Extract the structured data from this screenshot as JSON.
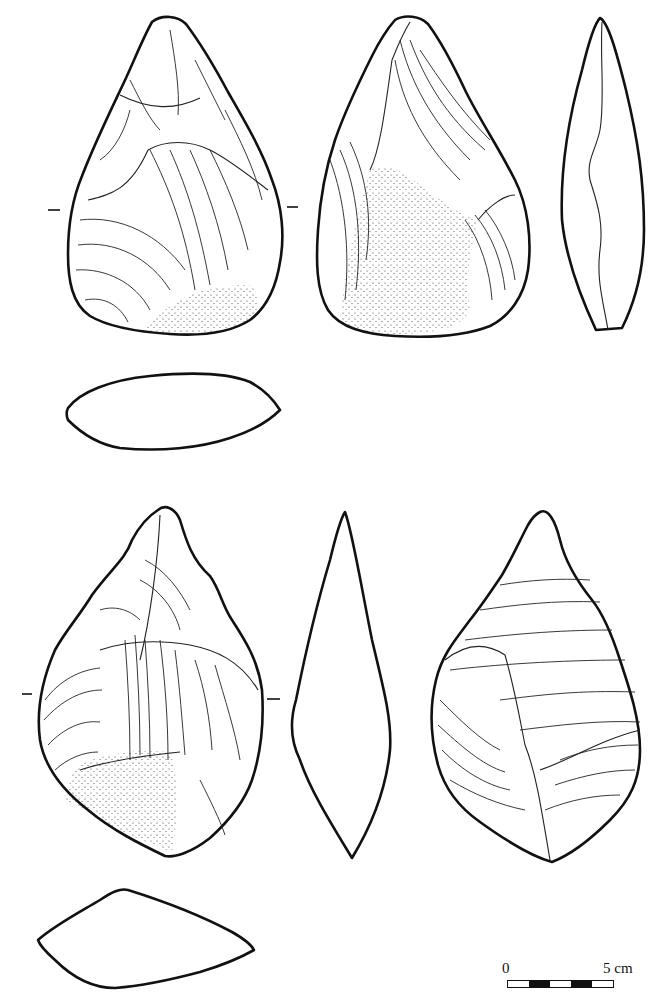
{
  "figure": {
    "artifacts": [
      {
        "id": "handaxe-1",
        "views": [
          "face-a",
          "face-b",
          "profile",
          "cross-section"
        ]
      },
      {
        "id": "handaxe-2",
        "views": [
          "face-a",
          "profile",
          "face-b",
          "cross-section"
        ]
      }
    ]
  },
  "scale": {
    "start_label": "0",
    "end_label": "5 cm",
    "segments": [
      "white",
      "black",
      "white",
      "black",
      "white"
    ],
    "colors": {
      "black": "#111111",
      "white": "#ffffff"
    }
  },
  "colors": {
    "line": "#111111",
    "background": "#ffffff"
  }
}
